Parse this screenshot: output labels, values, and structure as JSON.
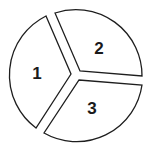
{
  "diagram": {
    "type": "divided-circle",
    "sections": [
      {
        "label": "1",
        "position": "left"
      },
      {
        "label": "2",
        "position": "top-right"
      },
      {
        "label": "3",
        "position": "bottom-right"
      }
    ],
    "colors": {
      "stroke": "#1e1e1e",
      "fill": "#ffffff"
    }
  }
}
